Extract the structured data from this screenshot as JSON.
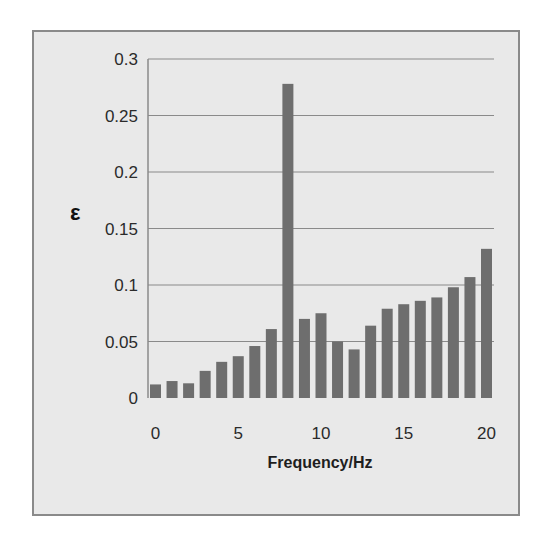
{
  "chart_data": {
    "type": "bar",
    "title": "",
    "xlabel": "Frequency/Hz",
    "ylabel": "ε",
    "x": [
      0,
      1,
      2,
      3,
      4,
      5,
      6,
      7,
      8,
      9,
      10,
      11,
      12,
      13,
      14,
      15,
      16,
      17,
      18,
      19,
      20
    ],
    "values": [
      0.012,
      0.015,
      0.013,
      0.024,
      0.032,
      0.037,
      0.046,
      0.061,
      0.278,
      0.07,
      0.075,
      0.05,
      0.043,
      0.064,
      0.079,
      0.083,
      0.086,
      0.089,
      0.098,
      0.107,
      0.132
    ],
    "ylim": [
      0,
      0.3
    ],
    "xlim": [
      0,
      20
    ],
    "yticks": [
      "0",
      "0.05",
      "0.1",
      "0.15",
      "0.2",
      "0.25",
      "0.3"
    ],
    "xticks": [
      "0",
      "5",
      "10",
      "15",
      "20"
    ],
    "grid": "horizontal",
    "legend": null,
    "bar_color": "#6e6e6e",
    "background_color": "#e9e9e9"
  }
}
